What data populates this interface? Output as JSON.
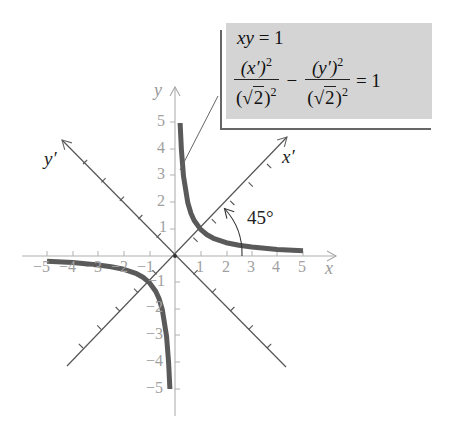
{
  "callout": {
    "line1_lhs": "xy",
    "line1_rhs": "= 1",
    "term1": {
      "num_base": "(x′)",
      "num_exp": "2",
      "den_radicand": "2",
      "den_exp": "2"
    },
    "operator": "−",
    "term2": {
      "num_base": "(y′)",
      "num_exp": "2",
      "den_radicand": "2",
      "den_exp": "2"
    },
    "rhs": "= 1",
    "panel_color": "#d4d4d4"
  },
  "axes": {
    "x_label": "x",
    "y_label": "y",
    "x_prime_label": "x′",
    "y_prime_label": "y′",
    "x_ticks_pos": [
      "1",
      "2",
      "3",
      "4",
      "5"
    ],
    "x_ticks_neg": [
      "−5",
      "−4",
      "−3",
      "−2",
      "−1"
    ],
    "y_ticks_pos": [
      "1",
      "2",
      "3",
      "4",
      "5"
    ],
    "y_ticks_neg": [
      "−1",
      "−2",
      "−3",
      "−4",
      "−5"
    ]
  },
  "angle_label": "45°",
  "curve": {
    "equation": "xy = 1",
    "color": "#555555",
    "domain": [
      0.2,
      5
    ]
  }
}
